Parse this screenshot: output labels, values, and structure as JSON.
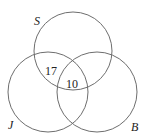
{
  "diagram": {
    "type": "venn",
    "sets": [
      {
        "name": "S",
        "cx": 73,
        "cy": 51,
        "r": 39,
        "label_x": 34,
        "label_y": 25
      },
      {
        "name": "J",
        "cx": 48,
        "cy": 92,
        "r": 40,
        "label_x": 8,
        "label_y": 129
      },
      {
        "name": "B",
        "cx": 97,
        "cy": 92,
        "r": 40,
        "label_x": 131,
        "label_y": 131
      }
    ],
    "regions": [
      {
        "sets": [
          "S",
          "J"
        ],
        "only": true,
        "value": "17",
        "x": 51,
        "y": 74
      },
      {
        "sets": [
          "S",
          "J",
          "B"
        ],
        "value": "10",
        "x": 72,
        "y": 87
      }
    ],
    "stroke_color": "#6e6e6e"
  }
}
